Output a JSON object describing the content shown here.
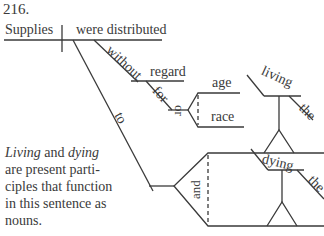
{
  "problem_number": "216.",
  "diagram": {
    "subject": "Supplies",
    "verb": "were distributed",
    "modifiers": {
      "preposition_1": "without",
      "object_1": "regard",
      "preposition_2": "for",
      "conjunction_1": "or",
      "object_2a": "age",
      "object_2b": "race",
      "preposition_3": "to",
      "conjunction_2": "and",
      "gerund_1": "living",
      "article_1": "the",
      "gerund_2": "dying",
      "article_2": "the"
    }
  },
  "note": {
    "word_1": "Living",
    "connector": " and ",
    "word_2": "dying",
    "rest": " are present parti-ciples that function in this sentence as nouns."
  }
}
